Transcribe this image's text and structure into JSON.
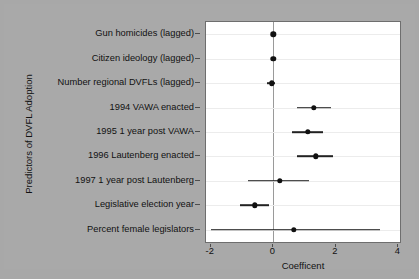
{
  "chart_data": {
    "type": "scatter",
    "title": "",
    "xlabel": "Coefficent",
    "ylabel": "Predictors of DVFL Adoption",
    "xlim": [
      -2.15,
      4.05
    ],
    "xticks": [
      -2,
      0,
      2,
      4
    ],
    "xticklabels": [
      "-2",
      "0",
      "2",
      "4"
    ],
    "grid": "horizontal",
    "legend": "none",
    "reference_line": 0,
    "categories": [
      "Gun homicides (lagged)",
      "Citizen ideology (lagged)",
      "Number regional DVFLs (lagged)",
      "1994 VAWA enacted",
      "1995 1 year post VAWA",
      "1996 Lautenberg enacted",
      "1997 1 year post Lautenberg",
      "Legislative election year",
      "Percent female legislators"
    ],
    "values": [
      0.0,
      0.0,
      -0.05,
      1.3,
      1.1,
      1.35,
      0.2,
      -0.6,
      0.65
    ],
    "ci_low": [
      0.0,
      0.0,
      -0.2,
      0.75,
      0.6,
      0.75,
      -0.8,
      -1.05,
      -2.0
    ],
    "ci_high": [
      0.0,
      0.0,
      0.05,
      1.85,
      1.6,
      1.9,
      1.15,
      -0.15,
      3.4
    ],
    "points": [
      {
        "label": "Gun homicides (lagged)",
        "estimate": 0.0,
        "ci_low": 0.0,
        "ci_high": 0.0
      },
      {
        "label": "Citizen ideology (lagged)",
        "estimate": 0.0,
        "ci_low": 0.0,
        "ci_high": 0.0
      },
      {
        "label": "Number regional DVFLs (lagged)",
        "estimate": -0.05,
        "ci_low": -0.2,
        "ci_high": 0.05
      },
      {
        "label": "1994 VAWA enacted",
        "estimate": 1.3,
        "ci_low": 0.75,
        "ci_high": 1.85
      },
      {
        "label": "1995 1 year post VAWA",
        "estimate": 1.1,
        "ci_low": 0.6,
        "ci_high": 1.6
      },
      {
        "label": "1996 Lautenberg enacted",
        "estimate": 1.35,
        "ci_low": 0.75,
        "ci_high": 1.9
      },
      {
        "label": "1997 1 year post Lautenberg",
        "estimate": 0.2,
        "ci_low": -0.8,
        "ci_high": 1.15
      },
      {
        "label": "Legislative election year",
        "estimate": -0.6,
        "ci_low": -1.05,
        "ci_high": -0.15
      },
      {
        "label": "Percent female legislators",
        "estimate": 0.65,
        "ci_low": -2.0,
        "ci_high": 3.4
      }
    ]
  },
  "colors": {
    "figure_background": "#a9a9a9",
    "panel_background": "#ffffff",
    "point": "#111111",
    "interval": "#222222",
    "gridline": "#ececec",
    "zero_line": "#9a9a9a",
    "axis_text": "#111111"
  }
}
